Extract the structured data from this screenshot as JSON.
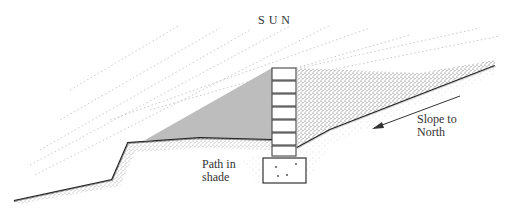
{
  "diagram": {
    "labels": {
      "sun": "SUN",
      "path_line1": "Path in",
      "path_line2": "shade",
      "slope_line1": "Slope to",
      "slope_line2": "North"
    },
    "elements": {
      "wall_blocks": 7,
      "footing": "concrete footing",
      "shade_region": "shadow cast by wall",
      "sun_rays": "dotted diagonal lines"
    },
    "colors": {
      "shade": "#bdbdbd",
      "ink": "#333333",
      "soil": "#555555"
    }
  }
}
